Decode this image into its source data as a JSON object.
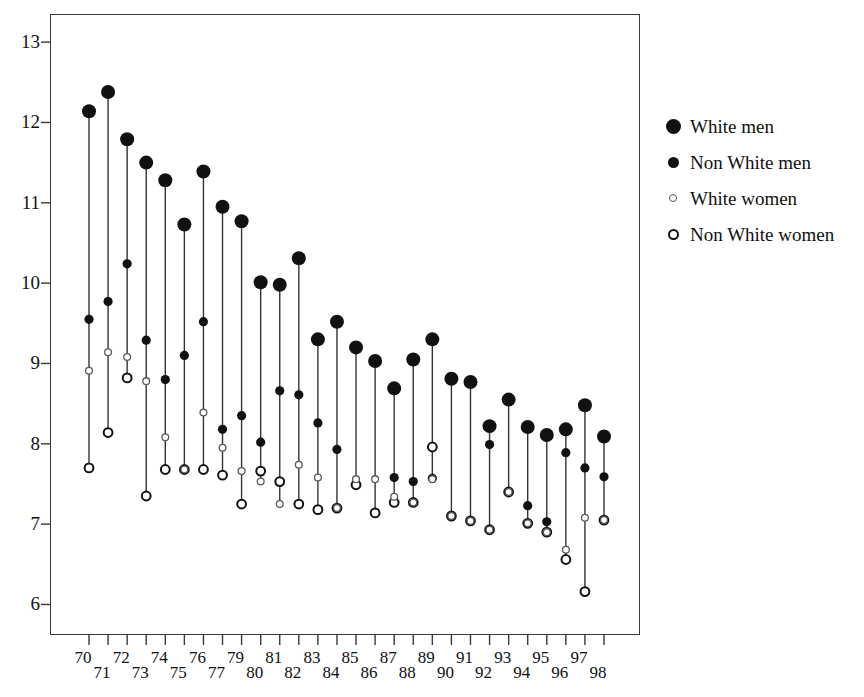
{
  "chart_data": {
    "type": "scatter",
    "title": "",
    "subtitle": "",
    "xlabel": "",
    "ylabel": "",
    "xlim": [
      69.2,
      98.8
    ],
    "ylim": [
      5.62,
      13.35
    ],
    "yticks": [
      6,
      7,
      8,
      9,
      10,
      11,
      12,
      13
    ],
    "grid": false,
    "legend_position": "right",
    "marker_styles": {
      "White men": "large-filled-circle",
      "Non White men": "medium-filled-circle",
      "White women": "small-open-circle",
      "Non White women": "medium-open-circle"
    },
    "connector": "vertical line joining the four series within each year",
    "categories": [
      "70",
      "71",
      "72",
      "73",
      "74",
      "75",
      "76",
      "77",
      "79",
      "80",
      "81",
      "82",
      "83",
      "84",
      "85",
      "86",
      "87",
      "88",
      "89",
      "90",
      "91",
      "92",
      "93",
      "94",
      "95",
      "96",
      "97",
      "98"
    ],
    "xtick_labels": [
      "70",
      "71",
      "72",
      "73",
      "74",
      "75",
      "76",
      "77",
      "79",
      "80",
      "81",
      "82",
      "83",
      "84",
      "85",
      "86",
      "87",
      "88",
      "89",
      "90",
      "91",
      "92",
      "93",
      "94",
      "95",
      "96",
      "97",
      "98"
    ],
    "series": [
      {
        "name": "White men",
        "marker": "large-filled-circle",
        "values": [
          12.14,
          12.38,
          11.79,
          11.5,
          11.28,
          10.73,
          11.39,
          10.95,
          10.77,
          10.01,
          9.98,
          10.31,
          9.3,
          9.52,
          9.2,
          9.03,
          8.69,
          9.05,
          9.3,
          8.81,
          8.77,
          8.22,
          8.55,
          8.21,
          8.11,
          8.18,
          8.48,
          8.09
        ]
      },
      {
        "name": "Non White men",
        "marker": "medium-filled-circle",
        "values": [
          9.55,
          9.77,
          10.24,
          9.29,
          8.8,
          9.1,
          9.52,
          8.18,
          8.35,
          8.02,
          8.66,
          8.61,
          8.26,
          7.93,
          7.49,
          7.14,
          7.58,
          7.53,
          7.57,
          7.11,
          7.04,
          7.99,
          7.4,
          7.23,
          7.03,
          7.89,
          7.7,
          7.59
        ]
      },
      {
        "name": "White women",
        "marker": "small-open-circle",
        "values": [
          8.91,
          9.14,
          9.08,
          8.78,
          8.08,
          7.68,
          8.39,
          7.95,
          7.66,
          7.53,
          7.25,
          7.74,
          7.58,
          7.2,
          7.56,
          7.56,
          7.34,
          7.27,
          7.56,
          7.1,
          7.04,
          6.93,
          7.4,
          7.01,
          6.9,
          6.68,
          7.08,
          7.05
        ]
      },
      {
        "name": "Non White women",
        "marker": "medium-open-circle",
        "values": [
          7.7,
          8.14,
          8.82,
          7.35,
          7.68,
          7.68,
          7.68,
          7.61,
          7.25,
          7.66,
          7.53,
          7.25,
          7.18,
          7.2,
          7.49,
          7.14,
          7.27,
          7.27,
          7.96,
          7.1,
          7.04,
          6.93,
          7.4,
          7.01,
          6.9,
          6.56,
          6.16,
          7.05
        ]
      }
    ],
    "colors": {
      "marker": "#111111",
      "connector": "#333333",
      "frame": "#3a3a3a"
    }
  },
  "legend": {
    "items": [
      {
        "label": "White men",
        "marker": "dot-lg"
      },
      {
        "label": "Non White men",
        "marker": "dot-md"
      },
      {
        "label": "White women",
        "marker": "dot-sm-open"
      },
      {
        "label": "Non White women",
        "marker": "dot-md-open"
      }
    ]
  }
}
